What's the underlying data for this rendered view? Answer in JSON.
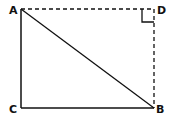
{
  "diagram": {
    "points": {
      "A": {
        "label": "A",
        "x": 21,
        "y": 9
      },
      "B": {
        "label": "B",
        "x": 154,
        "y": 108
      },
      "C": {
        "label": "C",
        "x": 21,
        "y": 108
      },
      "D": {
        "label": "D",
        "x": 154,
        "y": 9
      }
    },
    "solid_segments": [
      "AC",
      "CB",
      "AB"
    ],
    "dashed_segments": [
      "AD",
      "DB"
    ],
    "right_angle_marker": "D",
    "colors": {
      "line": "#111111",
      "background": "#ffffff"
    }
  }
}
